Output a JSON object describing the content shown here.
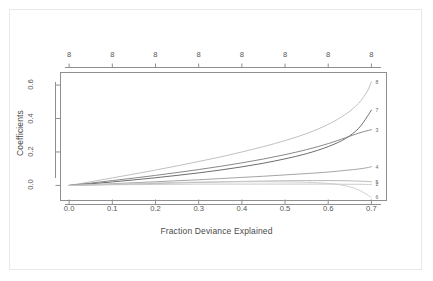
{
  "figure": {
    "background_color": "#ffffff",
    "frame_color": "#e8e8e8"
  },
  "chart_data": {
    "type": "line",
    "title": "",
    "xlabel": "Fraction Deviance Explained",
    "ylabel": "Coefficients",
    "xlim": [
      -0.02,
      0.735
    ],
    "ylim": [
      -0.09,
      0.675
    ],
    "grid": false,
    "legend": "none",
    "xticks": [
      0.0,
      0.1,
      0.2,
      0.3,
      0.4,
      0.5,
      0.6,
      0.7
    ],
    "xtick_labels": [
      "0.0",
      "0.1",
      "0.2",
      "0.3",
      "0.4",
      "0.5",
      "0.6",
      "0.7"
    ],
    "yticks": [
      0.0,
      0.2,
      0.4,
      0.6
    ],
    "ytick_labels": [
      "0.0",
      "0.2",
      "0.4",
      "0.6"
    ],
    "top_axis": {
      "label": "",
      "ticks": [
        0.0,
        0.1,
        0.2,
        0.3,
        0.4,
        0.5,
        0.6,
        0.7
      ],
      "tick_labels": [
        "8",
        "8",
        "8",
        "8",
        "8",
        "8",
        "8",
        "8"
      ]
    },
    "series": [
      {
        "name": "8",
        "end_label": "8",
        "color": "#b9b9b9",
        "x": [
          0.0,
          0.05,
          0.1,
          0.15,
          0.2,
          0.25,
          0.3,
          0.35,
          0.4,
          0.45,
          0.5,
          0.55,
          0.6,
          0.64,
          0.67,
          0.69,
          0.7
        ],
        "values": [
          0.0,
          0.022,
          0.045,
          0.068,
          0.092,
          0.117,
          0.143,
          0.17,
          0.2,
          0.232,
          0.268,
          0.31,
          0.365,
          0.425,
          0.49,
          0.56,
          0.62
        ]
      },
      {
        "name": "7",
        "end_label": "7",
        "color": "#5c5c5c",
        "x": [
          0.0,
          0.05,
          0.1,
          0.15,
          0.2,
          0.25,
          0.3,
          0.35,
          0.4,
          0.45,
          0.5,
          0.55,
          0.6,
          0.64,
          0.67,
          0.69,
          0.7
        ],
        "values": [
          0.0,
          0.01,
          0.021,
          0.033,
          0.046,
          0.06,
          0.075,
          0.092,
          0.111,
          0.133,
          0.159,
          0.19,
          0.232,
          0.28,
          0.34,
          0.41,
          0.45
        ]
      },
      {
        "name": "3",
        "end_label": "3",
        "color": "#7a7a7a",
        "x": [
          0.0,
          0.05,
          0.1,
          0.15,
          0.2,
          0.25,
          0.3,
          0.35,
          0.4,
          0.45,
          0.5,
          0.55,
          0.6,
          0.64,
          0.67,
          0.69,
          0.7
        ],
        "values": [
          0.0,
          0.014,
          0.029,
          0.044,
          0.06,
          0.077,
          0.095,
          0.114,
          0.135,
          0.158,
          0.184,
          0.214,
          0.25,
          0.285,
          0.312,
          0.327,
          0.333
        ]
      },
      {
        "name": "4",
        "end_label": "4",
        "color": "#9a9a9a",
        "x": [
          0.0,
          0.05,
          0.1,
          0.15,
          0.2,
          0.25,
          0.3,
          0.35,
          0.4,
          0.45,
          0.5,
          0.55,
          0.6,
          0.64,
          0.67,
          0.69,
          0.7
        ],
        "values": [
          0.0,
          0.005,
          0.01,
          0.016,
          0.022,
          0.028,
          0.034,
          0.041,
          0.048,
          0.055,
          0.063,
          0.071,
          0.08,
          0.09,
          0.098,
          0.106,
          0.112
        ]
      },
      {
        "name": "5",
        "end_label": "5",
        "color": "#b0b0b0",
        "x": [
          0.0,
          0.05,
          0.1,
          0.15,
          0.2,
          0.25,
          0.3,
          0.35,
          0.4,
          0.45,
          0.5,
          0.55,
          0.6,
          0.64,
          0.67,
          0.69,
          0.7
        ],
        "values": [
          0.0,
          0.003,
          0.006,
          0.009,
          0.012,
          0.015,
          0.018,
          0.021,
          0.024,
          0.026,
          0.028,
          0.029,
          0.029,
          0.028,
          0.026,
          0.024,
          0.022
        ]
      },
      {
        "name": "2",
        "end_label": "2",
        "color": "#c4c4c4",
        "x": [
          0.0,
          0.05,
          0.1,
          0.15,
          0.2,
          0.25,
          0.3,
          0.35,
          0.4,
          0.45,
          0.5,
          0.55,
          0.6,
          0.64,
          0.67,
          0.69,
          0.7
        ],
        "values": [
          0.0,
          0.002,
          0.004,
          0.005,
          0.006,
          0.007,
          0.008,
          0.008,
          0.008,
          0.008,
          0.008,
          0.008,
          0.008,
          0.007,
          0.007,
          0.006,
          0.006
        ]
      },
      {
        "name": "6",
        "end_label": "6",
        "color": "#c9c9c9",
        "x": [
          0.0,
          0.05,
          0.1,
          0.15,
          0.2,
          0.25,
          0.3,
          0.35,
          0.4,
          0.45,
          0.5,
          0.55,
          0.6,
          0.63,
          0.655,
          0.675,
          0.69,
          0.7
        ],
        "values": [
          0.0,
          0.004,
          0.008,
          0.012,
          0.015,
          0.018,
          0.02,
          0.021,
          0.022,
          0.022,
          0.021,
          0.019,
          0.012,
          0.003,
          -0.012,
          -0.032,
          -0.055,
          -0.072
        ]
      }
    ]
  }
}
